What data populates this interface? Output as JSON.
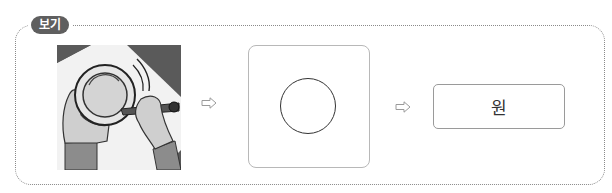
{
  "example": {
    "badge_label": "보기",
    "steps": [
      {
        "type": "image",
        "description": "hands tracing around a cup with a pencil"
      },
      {
        "type": "shape",
        "shape": "circle"
      },
      {
        "type": "label",
        "text": "원"
      }
    ],
    "arrow_icon": "right-outline-arrow"
  },
  "colors": {
    "frame_border": "#8a8a8a",
    "badge_bg": "#5f5f5f",
    "box_border": "#b8b8b8",
    "answer_border": "#9a9a9a"
  }
}
